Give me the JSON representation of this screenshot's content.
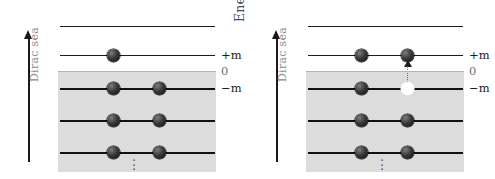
{
  "figure": {
    "background": "#ffffff",
    "sea_color": "#dcdcdc",
    "particle_color": "#1b1b1b",
    "hole_color": "#ffffff",
    "zero_line_color": "#b4b4b4"
  },
  "axis": {
    "label": "Energy",
    "direction": "up",
    "label_color": "#4b4b4b"
  },
  "sea": {
    "label": "Dirac sea",
    "label_color": "#8c8c8c"
  },
  "levels": {
    "continuum_top": "",
    "plus_m": "+m",
    "zero": "0",
    "minus_m": "−m"
  },
  "ellipsis": {
    "glyph": "·"
  },
  "panels": [
    {
      "name": "ground-state",
      "caption": "",
      "levels": [
        {
          "id": "continuum-top",
          "label": "",
          "y": 26,
          "style": "thin",
          "particles": []
        },
        {
          "id": "plus-m",
          "label": "+m",
          "y": 55,
          "style": "thin",
          "particles": [
            {
              "type": "particle",
              "x": 0.33
            }
          ]
        },
        {
          "id": "zero",
          "label": "0",
          "y": 71,
          "style": "zero",
          "particles": []
        },
        {
          "id": "minus-m",
          "label": "−m",
          "y": 88,
          "style": "thick",
          "particles": [
            {
              "type": "particle",
              "x": 0.33
            },
            {
              "type": "particle",
              "x": 0.63
            }
          ]
        },
        {
          "id": "sea-1",
          "label": "",
          "y": 120,
          "style": "thick",
          "particles": [
            {
              "type": "particle",
              "x": 0.33
            },
            {
              "type": "particle",
              "x": 0.63
            }
          ]
        },
        {
          "id": "sea-2",
          "label": "",
          "y": 152,
          "style": "thick",
          "particles": [
            {
              "type": "particle",
              "x": 0.33
            },
            {
              "type": "particle",
              "x": 0.63
            }
          ]
        }
      ],
      "excitation": null
    },
    {
      "name": "pair-created-state",
      "caption": "",
      "levels": [
        {
          "id": "continuum-top",
          "label": "",
          "y": 26,
          "style": "thin",
          "particles": []
        },
        {
          "id": "plus-m",
          "label": "+m",
          "y": 55,
          "style": "thin",
          "particles": [
            {
              "type": "particle",
              "x": 0.33
            },
            {
              "type": "particle",
              "x": 0.63
            }
          ]
        },
        {
          "id": "zero",
          "label": "0",
          "y": 71,
          "style": "zero",
          "particles": []
        },
        {
          "id": "minus-m",
          "label": "−m",
          "y": 88,
          "style": "thick",
          "particles": [
            {
              "type": "particle",
              "x": 0.33
            },
            {
              "type": "hole",
              "x": 0.63
            }
          ]
        },
        {
          "id": "sea-1",
          "label": "",
          "y": 120,
          "style": "thick",
          "particles": [
            {
              "type": "particle",
              "x": 0.33
            },
            {
              "type": "particle",
              "x": 0.63
            }
          ]
        },
        {
          "id": "sea-2",
          "label": "",
          "y": 152,
          "style": "thick",
          "particles": [
            {
              "type": "particle",
              "x": 0.33
            },
            {
              "type": "particle",
              "x": 0.63
            }
          ]
        }
      ],
      "excitation": {
        "from_level": "minus-m",
        "to_level": "plus-m",
        "x": 0.63
      }
    }
  ]
}
